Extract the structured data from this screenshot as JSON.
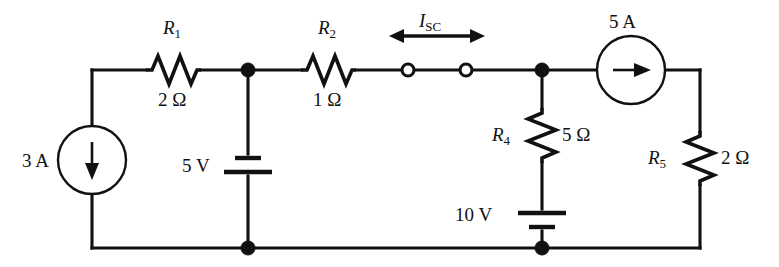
{
  "figure": {
    "type": "electrical-circuit-schematic"
  },
  "labels": {
    "r1_name": "R",
    "r1_sub": "1",
    "r1_value": "2 Ω",
    "r2_name": "R",
    "r2_sub": "2",
    "r2_value": "1 Ω",
    "r4_name": "R",
    "r4_sub": "4",
    "r4_value": "5 Ω",
    "r5_name": "R",
    "r5_sub": "5",
    "r5_value": "2 Ω",
    "isc_name": "I",
    "isc_sub": "SC",
    "source_3a": "3 A",
    "source_5a": "5 A",
    "battery_5v": "5 V",
    "battery_10v": "10 V"
  },
  "components": [
    {
      "id": "R1",
      "kind": "resistor",
      "label": "R1",
      "value": "2 Ω",
      "orientation": "horizontal"
    },
    {
      "id": "R2",
      "kind": "resistor",
      "label": "R2",
      "value": "1 Ω",
      "orientation": "horizontal"
    },
    {
      "id": "R4",
      "kind": "resistor",
      "label": "R4",
      "value": "5 Ω",
      "orientation": "vertical"
    },
    {
      "id": "R5",
      "kind": "resistor",
      "label": "R5",
      "value": "2 Ω",
      "orientation": "vertical"
    },
    {
      "id": "I1",
      "kind": "current-source",
      "value": "3 A",
      "direction": "down"
    },
    {
      "id": "I2",
      "kind": "current-source",
      "value": "5 A",
      "direction": "right"
    },
    {
      "id": "V1",
      "kind": "battery",
      "value": "5 V",
      "orientation": "vertical"
    },
    {
      "id": "V2",
      "kind": "battery",
      "value": "10 V",
      "orientation": "vertical"
    },
    {
      "id": "ISC",
      "kind": "measurement-annotation",
      "value": "I_SC",
      "note": "short-circuit current across open terminals"
    }
  ],
  "colors": {
    "ink": "#111111",
    "background": "#ffffff"
  }
}
